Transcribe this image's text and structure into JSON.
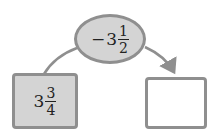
{
  "diagram": {
    "top_node": {
      "sign": "−",
      "whole": "3",
      "numerator": "1",
      "denominator": "2"
    },
    "left_node": {
      "whole": "3",
      "numerator": "3",
      "denominator": "4"
    },
    "right_node": {
      "value": ""
    },
    "colors": {
      "fill": "#d4d4d4",
      "border": "#8f8f8f",
      "line": "#8f8f8f"
    }
  }
}
